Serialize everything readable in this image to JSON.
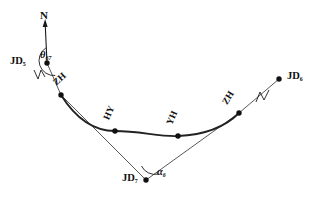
{
  "figure": {
    "type": "surveying-horizontal-curve-diagram",
    "background_color": "#ffffff",
    "stroke_color": "#1a1a1a",
    "curve_color": "#2b2b2b",
    "width": 315,
    "height": 202
  },
  "north_arrow": {
    "label": "N",
    "from": {
      "x": 47,
      "y": 63
    },
    "to": {
      "x": 45,
      "y": 20
    }
  },
  "vertices": [
    {
      "id": "jd-left",
      "label": "JD",
      "subscript": "5",
      "x": 47,
      "y": 63,
      "label_x": 10,
      "label_y": 57,
      "role": "intersection-point"
    },
    {
      "id": "zh-left",
      "label": "ZH",
      "subscript": "",
      "x": 61,
      "y": 95,
      "label_x": 61,
      "label_y": 79,
      "rotation": -42,
      "role": "tangent-to-spiral"
    },
    {
      "id": "hy-left",
      "label": "HY",
      "subscript": "",
      "x": 115,
      "y": 131,
      "label_x": 113,
      "label_y": 113,
      "rotation": -66,
      "role": "spiral-to-circular"
    },
    {
      "id": "yh-right",
      "label": "YH",
      "subscript": "",
      "x": 178,
      "y": 136,
      "label_x": 176,
      "label_y": 118,
      "rotation": -66,
      "role": "circular-to-spiral"
    },
    {
      "id": "zh-right",
      "label": "ZH",
      "subscript": "",
      "x": 239,
      "y": 113,
      "label_x": 231,
      "label_y": 99,
      "rotation": -58,
      "role": "spiral-to-tangent"
    },
    {
      "id": "jd-right",
      "label": "JD",
      "subscript": "6",
      "x": 279,
      "y": 79,
      "label_x": 287,
      "label_y": 72,
      "role": "intersection-point"
    },
    {
      "id": "jd-bottom",
      "label": "JD",
      "subscript": "7",
      "x": 146,
      "y": 180,
      "label_x": 124,
      "label_y": 173,
      "role": "intersection-point"
    }
  ],
  "angles": [
    {
      "id": "theta",
      "label": "θ",
      "subscript": "67",
      "at": "jd-left",
      "label_x": 41,
      "label_y": 52,
      "description": "azimuth angle from north to tangent line"
    },
    {
      "id": "alpha",
      "label": "α",
      "subscript": "6",
      "at": "jd-bottom",
      "label_x": 156,
      "label_y": 168,
      "description": "deflection angle at intersection point"
    }
  ],
  "break_marks": [
    {
      "id": "break-left",
      "x": 39,
      "y": 75,
      "rotation": 28,
      "description": "line-break zigzag on left tangent"
    },
    {
      "id": "break-right",
      "x": 262,
      "y": 96,
      "rotation": -40,
      "description": "line-break zigzag on right tangent"
    }
  ],
  "segments": [
    {
      "id": "tangent-left",
      "from": "jd-left",
      "to": "zh-left",
      "style": "thin"
    },
    {
      "id": "tangent-back-left",
      "from": "zh-left",
      "to": "jd-bottom",
      "style": "thin"
    },
    {
      "id": "tangent-forward",
      "from": "jd-bottom",
      "to": "zh-right",
      "style": "thin"
    },
    {
      "id": "tangent-right",
      "from": "zh-right",
      "to": "jd-right",
      "style": "thin"
    },
    {
      "id": "curve",
      "from": "zh-left",
      "to": "zh-right",
      "style": "thick-arc",
      "description": "spiral-circular-spiral alignment curve through HY and YH"
    }
  ]
}
